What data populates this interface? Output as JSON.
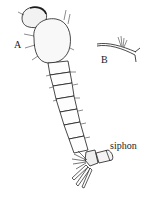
{
  "figure": {
    "labels": {
      "a": "A",
      "b": "B",
      "siphon": "siphon"
    },
    "colors": {
      "ink": "#1a1a1a",
      "background": "#ffffff"
    }
  }
}
